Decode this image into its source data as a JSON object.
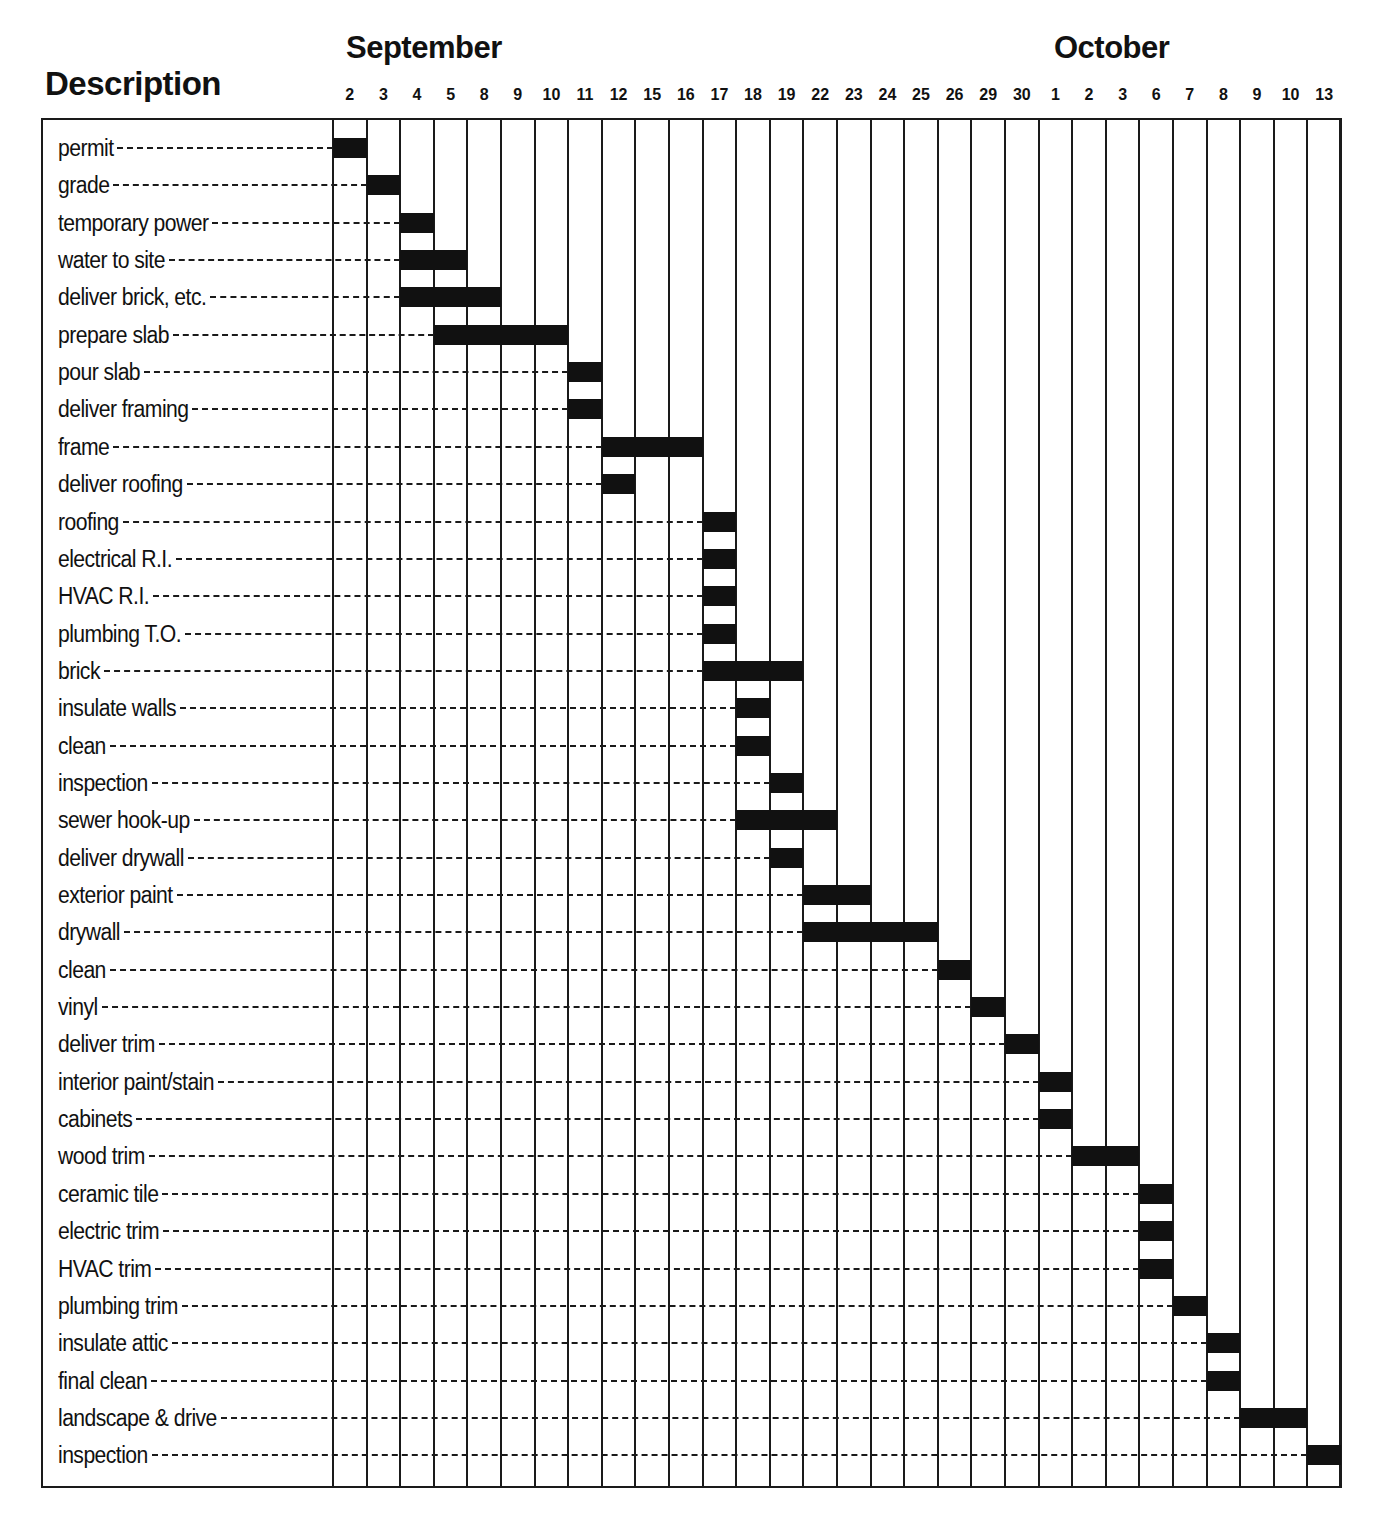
{
  "chart_data": {
    "type": "gantt",
    "title": "",
    "header": {
      "description_label": "Description"
    },
    "months": [
      {
        "name": "September",
        "start_col": 0
      },
      {
        "name": "October",
        "start_col": 21
      }
    ],
    "columns": [
      "2",
      "3",
      "4",
      "5",
      "8",
      "9",
      "10",
      "11",
      "12",
      "15",
      "16",
      "17",
      "18",
      "19",
      "22",
      "23",
      "24",
      "25",
      "26",
      "29",
      "30",
      "1",
      "2",
      "3",
      "6",
      "7",
      "8",
      "9",
      "10",
      "13"
    ],
    "column_months": [
      "Sep",
      "Sep",
      "Sep",
      "Sep",
      "Sep",
      "Sep",
      "Sep",
      "Sep",
      "Sep",
      "Sep",
      "Sep",
      "Sep",
      "Sep",
      "Sep",
      "Sep",
      "Sep",
      "Sep",
      "Sep",
      "Sep",
      "Sep",
      "Sep",
      "Oct",
      "Oct",
      "Oct",
      "Oct",
      "Oct",
      "Oct",
      "Oct",
      "Oct",
      "Oct"
    ],
    "tasks": [
      {
        "label": "permit",
        "start": "Sep 2",
        "end": "Sep 2",
        "start_col": 0,
        "span": 1
      },
      {
        "label": "grade",
        "start": "Sep 3",
        "end": "Sep 3",
        "start_col": 1,
        "span": 1
      },
      {
        "label": "temporary power",
        "start": "Sep 4",
        "end": "Sep 4",
        "start_col": 2,
        "span": 1
      },
      {
        "label": "water to site",
        "start": "Sep 4",
        "end": "Sep 5",
        "start_col": 2,
        "span": 2
      },
      {
        "label": "deliver brick, etc.",
        "start": "Sep 4",
        "end": "Sep 8",
        "start_col": 2,
        "span": 3
      },
      {
        "label": "prepare slab",
        "start": "Sep 5",
        "end": "Sep 10",
        "start_col": 3,
        "span": 4
      },
      {
        "label": "pour slab",
        "start": "Sep 11",
        "end": "Sep 11",
        "start_col": 7,
        "span": 1
      },
      {
        "label": "deliver framing",
        "start": "Sep 11",
        "end": "Sep 11",
        "start_col": 7,
        "span": 1
      },
      {
        "label": "frame",
        "start": "Sep 12",
        "end": "Sep 16",
        "start_col": 8,
        "span": 3
      },
      {
        "label": "deliver roofing",
        "start": "Sep 12",
        "end": "Sep 12",
        "start_col": 8,
        "span": 1
      },
      {
        "label": "roofing",
        "start": "Sep 17",
        "end": "Sep 17",
        "start_col": 11,
        "span": 1
      },
      {
        "label": "electrical R.I.",
        "start": "Sep 17",
        "end": "Sep 17",
        "start_col": 11,
        "span": 1
      },
      {
        "label": "HVAC R.I.",
        "start": "Sep 17",
        "end": "Sep 17",
        "start_col": 11,
        "span": 1
      },
      {
        "label": "plumbing T.O.",
        "start": "Sep 17",
        "end": "Sep 17",
        "start_col": 11,
        "span": 1
      },
      {
        "label": "brick",
        "start": "Sep 17",
        "end": "Sep 19",
        "start_col": 11,
        "span": 3
      },
      {
        "label": "insulate walls",
        "start": "Sep 18",
        "end": "Sep 18",
        "start_col": 12,
        "span": 1
      },
      {
        "label": "clean",
        "start": "Sep 18",
        "end": "Sep 18",
        "start_col": 12,
        "span": 1
      },
      {
        "label": "inspection",
        "start": "Sep 19",
        "end": "Sep 19",
        "start_col": 13,
        "span": 1
      },
      {
        "label": "sewer hook-up",
        "start": "Sep 18",
        "end": "Sep 22",
        "start_col": 12,
        "span": 3
      },
      {
        "label": "deliver drywall",
        "start": "Sep 19",
        "end": "Sep 19",
        "start_col": 13,
        "span": 1
      },
      {
        "label": "exterior paint",
        "start": "Sep 22",
        "end": "Sep 23",
        "start_col": 14,
        "span": 2
      },
      {
        "label": "drywall",
        "start": "Sep 22",
        "end": "Sep 25",
        "start_col": 14,
        "span": 4
      },
      {
        "label": "clean",
        "start": "Sep 26",
        "end": "Sep 26",
        "start_col": 18,
        "span": 1
      },
      {
        "label": "vinyl",
        "start": "Sep 29",
        "end": "Sep 29",
        "start_col": 19,
        "span": 1
      },
      {
        "label": "deliver trim",
        "start": "Sep 30",
        "end": "Sep 30",
        "start_col": 20,
        "span": 1
      },
      {
        "label": "interior paint/stain",
        "start": "Oct 1",
        "end": "Oct 1",
        "start_col": 21,
        "span": 1
      },
      {
        "label": "cabinets",
        "start": "Oct 1",
        "end": "Oct 1",
        "start_col": 21,
        "span": 1
      },
      {
        "label": "wood trim",
        "start": "Oct 2",
        "end": "Oct 3",
        "start_col": 22,
        "span": 2
      },
      {
        "label": "ceramic tile",
        "start": "Oct 6",
        "end": "Oct 6",
        "start_col": 24,
        "span": 1
      },
      {
        "label": "electric trim",
        "start": "Oct 6",
        "end": "Oct 6",
        "start_col": 24,
        "span": 1
      },
      {
        "label": "HVAC trim",
        "start": "Oct 6",
        "end": "Oct 6",
        "start_col": 24,
        "span": 1
      },
      {
        "label": "plumbing trim",
        "start": "Oct 7",
        "end": "Oct 7",
        "start_col": 25,
        "span": 1
      },
      {
        "label": "insulate attic",
        "start": "Oct 8",
        "end": "Oct 8",
        "start_col": 26,
        "span": 1
      },
      {
        "label": "final clean",
        "start": "Oct 8",
        "end": "Oct 8",
        "start_col": 26,
        "span": 1
      },
      {
        "label": "landscape & drive",
        "start": "Oct 9",
        "end": "Oct 10",
        "start_col": 27,
        "span": 2
      },
      {
        "label": "inspection",
        "start": "Oct 13",
        "end": "Oct 13",
        "start_col": 29,
        "span": 1
      }
    ],
    "grid": true,
    "legend": null
  }
}
